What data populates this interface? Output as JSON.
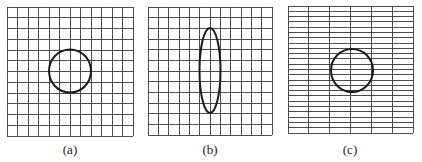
{
  "figure": {
    "panels": [
      {
        "id": "a",
        "label": "(a)",
        "grid": {
          "x": 7,
          "y": 7,
          "width": 126,
          "height": 129,
          "columns": 12,
          "rows": 12
        },
        "shape": {
          "type": "circle",
          "cx": 70,
          "cy": 71,
          "rx": 21,
          "ry": 21.5
        },
        "label_pos": {
          "x": 70,
          "y": 154
        }
      },
      {
        "id": "b",
        "label": "(b)",
        "grid": {
          "x": 148,
          "y": 7,
          "width": 124,
          "height": 128,
          "columns": 12,
          "rows": 12
        },
        "shape": {
          "type": "ellipse",
          "cx": 210,
          "cy": 70.5,
          "rx": 10.5,
          "ry": 42.5
        },
        "label_pos": {
          "x": 210,
          "y": 154
        }
      },
      {
        "id": "c",
        "label": "(c)",
        "grid": {
          "x": 288,
          "y": 6,
          "width": 125,
          "height": 127,
          "columns": 6,
          "rows": 24
        },
        "shape": {
          "type": "circle",
          "cx": 352,
          "cy": 70.5,
          "rx": 21,
          "ry": 21.5
        },
        "label_pos": {
          "x": 350,
          "y": 154
        }
      }
    ]
  }
}
